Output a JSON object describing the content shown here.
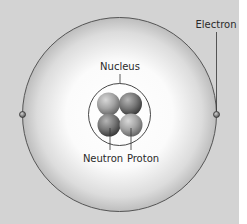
{
  "diagram": {
    "labels": {
      "electron": "Electron",
      "nucleus": "Nucleus",
      "neutron": "Neutron",
      "proton": "Proton"
    },
    "colors": {
      "background": "#d3d3d3",
      "outer_shell_edge": "#555555",
      "shell_center": "#ffffff",
      "neutron": "#6e6e6e",
      "proton": "#9a9a9a"
    },
    "particles": {
      "electrons": 2,
      "protons": 2,
      "neutrons": 2
    }
  }
}
